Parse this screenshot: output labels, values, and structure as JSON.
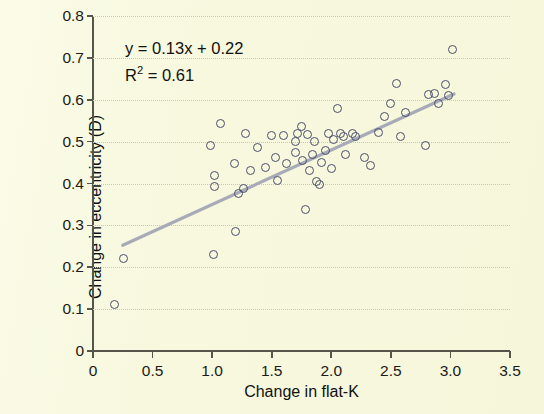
{
  "chart_data": {
    "type": "scatter",
    "title": "",
    "xlabel": "Change in flat-K",
    "ylabel": "Change in eccentricity (D)",
    "xlim": [
      0,
      3.5
    ],
    "ylim": [
      0,
      0.8
    ],
    "xticks": [
      "0",
      "0.5",
      "1.0",
      "1.5",
      "2.0",
      "2.5",
      "3.0",
      "3.5"
    ],
    "xtick_values": [
      0,
      0.5,
      1.0,
      1.5,
      2.0,
      2.5,
      3.0,
      3.5
    ],
    "yticks": [
      "0",
      "0.1",
      "0.2",
      "0.3",
      "0.4",
      "0.5",
      "0.6",
      "0.7",
      "0.8"
    ],
    "ytick_values": [
      0,
      0.1,
      0.2,
      0.3,
      0.4,
      0.5,
      0.6,
      0.7,
      0.8
    ],
    "grid": "horizontal-dotted",
    "legend": "none",
    "marker": "open-circle",
    "marker_color": "#4b4f6b",
    "background_color": "#f7f8de",
    "trendline_color": "#a8aab8",
    "annotations": {
      "equation": "y = 0.13x + 0.22",
      "r_squared_label": "R",
      "r_squared_exponent": "2",
      "r_squared_value": " = 0.61"
    },
    "fit": {
      "slope": 0.13,
      "intercept": 0.22,
      "r_squared": 0.61,
      "x_start": 0.25,
      "x_end": 3.03
    },
    "points": [
      [
        0.18,
        0.112
      ],
      [
        0.26,
        0.222
      ],
      [
        0.99,
        0.49
      ],
      [
        1.01,
        0.23
      ],
      [
        1.02,
        0.42
      ],
      [
        1.02,
        0.392
      ],
      [
        1.07,
        0.543
      ],
      [
        1.19,
        0.447
      ],
      [
        1.2,
        0.285
      ],
      [
        1.22,
        0.375
      ],
      [
        1.26,
        0.387
      ],
      [
        1.28,
        0.52
      ],
      [
        1.32,
        0.432
      ],
      [
        1.38,
        0.487
      ],
      [
        1.45,
        0.438
      ],
      [
        1.5,
        0.515
      ],
      [
        1.53,
        0.463
      ],
      [
        1.55,
        0.408
      ],
      [
        1.6,
        0.515
      ],
      [
        1.62,
        0.448
      ],
      [
        1.7,
        0.5
      ],
      [
        1.7,
        0.475
      ],
      [
        1.72,
        0.52
      ],
      [
        1.75,
        0.535
      ],
      [
        1.76,
        0.455
      ],
      [
        1.78,
        0.338
      ],
      [
        1.8,
        0.518
      ],
      [
        1.82,
        0.432
      ],
      [
        1.84,
        0.47
      ],
      [
        1.86,
        0.5
      ],
      [
        1.88,
        0.405
      ],
      [
        1.9,
        0.398
      ],
      [
        1.92,
        0.45
      ],
      [
        1.95,
        0.478
      ],
      [
        1.98,
        0.52
      ],
      [
        2.0,
        0.436
      ],
      [
        2.02,
        0.505
      ],
      [
        2.05,
        0.578
      ],
      [
        2.08,
        0.52
      ],
      [
        2.1,
        0.512
      ],
      [
        2.12,
        0.47
      ],
      [
        2.18,
        0.52
      ],
      [
        2.2,
        0.512
      ],
      [
        2.28,
        0.462
      ],
      [
        2.33,
        0.443
      ],
      [
        2.4,
        0.522
      ],
      [
        2.45,
        0.56
      ],
      [
        2.5,
        0.592
      ],
      [
        2.55,
        0.638
      ],
      [
        2.58,
        0.512
      ],
      [
        2.62,
        0.57
      ],
      [
        2.79,
        0.49
      ],
      [
        2.82,
        0.612
      ],
      [
        2.87,
        0.616
      ],
      [
        2.9,
        0.59
      ],
      [
        2.96,
        0.636
      ],
      [
        2.98,
        0.61
      ],
      [
        3.02,
        0.72
      ]
    ]
  }
}
